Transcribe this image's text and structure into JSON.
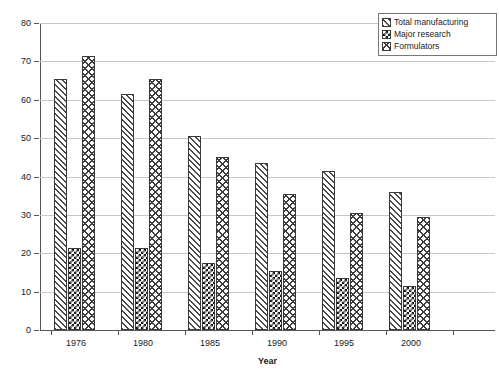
{
  "chart_data": {
    "type": "bar",
    "title": "",
    "xlabel": "Year",
    "ylabel": "Number of companies",
    "categories": [
      "1976",
      "1980",
      "1985",
      "1990",
      "1995",
      "2000"
    ],
    "ylim": [
      0,
      80
    ],
    "yticks": [
      0,
      10,
      20,
      30,
      40,
      50,
      60,
      70,
      80
    ],
    "grid": true,
    "legend_position": "top-right",
    "series": [
      {
        "name": "Total manufacturing",
        "pattern": "diagonal-hatch",
        "values": [
          65.5,
          61.5,
          50.5,
          43.5,
          41.5,
          36
        ]
      },
      {
        "name": "Major research",
        "pattern": "checkerboard",
        "values": [
          21.5,
          21.5,
          17.5,
          15.5,
          13.5,
          11.5
        ]
      },
      {
        "name": "Formulators",
        "pattern": "cross-hatch",
        "values": [
          71.5,
          65.5,
          45,
          35.5,
          30.5,
          29.5
        ]
      }
    ]
  }
}
